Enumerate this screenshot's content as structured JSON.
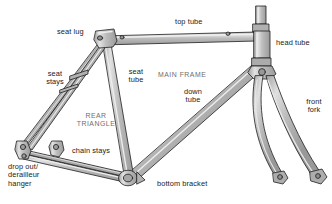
{
  "diagram": {
    "background_color": "#ffffff",
    "tube_fill": "#b4b4b4",
    "tube_highlight": "#dcdcdc",
    "tube_shadow": "#8f8f8f",
    "outline_color": "#1f1f1f",
    "label_color": "#1a1a1a",
    "region_label_color": "#6e6e6e"
  },
  "labels": {
    "seat_lug": "seat lug",
    "top_tube": "top tube",
    "head_tube": "head tube",
    "seat_stays": "seat\nstays",
    "seat_tube": "seat\ntube",
    "main_frame": "MAIN FRAME",
    "down_tube": "down\ntube",
    "front_fork": "front\nfork",
    "rear_triangle": "REAR\nTRIANGLE",
    "chain_stays": "chain stays",
    "drop_out": "drop out/\nderailleur\nhanger",
    "bottom_bracket": "bottom bracket"
  }
}
